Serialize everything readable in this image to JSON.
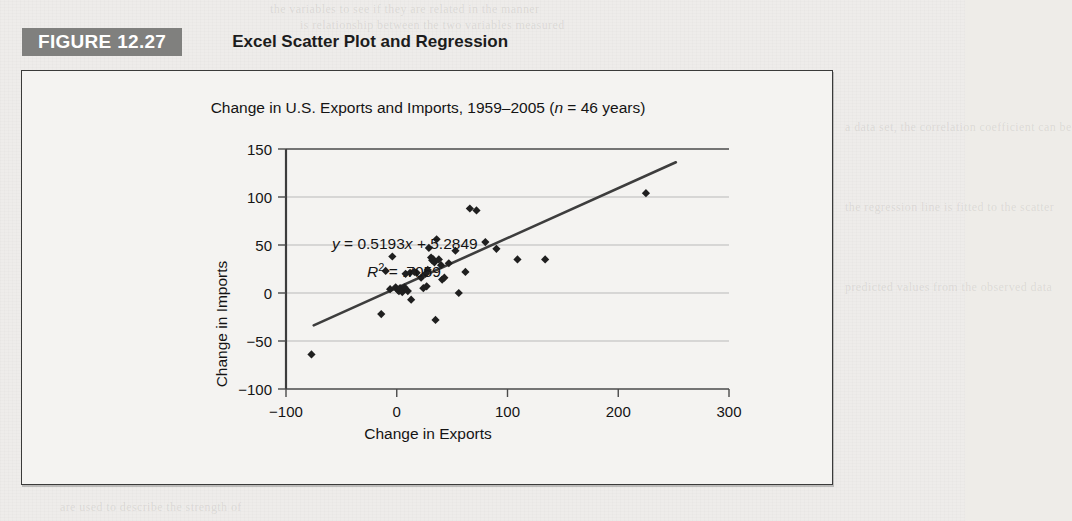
{
  "figure": {
    "badge_label": "FIGURE 12.27",
    "title": "Excel Scatter Plot and Regression"
  },
  "chart_data": {
    "type": "scatter",
    "title": "Change in U.S. Exports and Imports, 1959–2005 (n = 46 years)",
    "title_parts": {
      "before_n": "Change in U.S. Exports and Imports, 1959–2005 (",
      "n_symbol": "n",
      "after_n": " = 46 years)"
    },
    "xlabel": "Change in Exports",
    "ylabel": "Change in Imports",
    "xlim": [
      -100,
      300
    ],
    "ylim": [
      -100,
      150
    ],
    "xticks": [
      -100,
      0,
      100,
      200,
      300
    ],
    "yticks": [
      -100,
      -50,
      0,
      50,
      100,
      150
    ],
    "xtick_labels": [
      "−100",
      "0",
      "100",
      "200",
      "300"
    ],
    "ytick_labels": [
      "−100",
      "−50",
      "0",
      "50",
      "100",
      "150"
    ],
    "grid": "horizontal",
    "legend": "none",
    "marker": "diamond",
    "marker_color": "#1f1f1f",
    "line_color": "#3d3d3d",
    "annotations": {
      "equation": "y = 0.5193x + 5.2849",
      "equation_parts": {
        "y_symbol": "y",
        "rest_before_x": " = 0.5193",
        "x_symbol": "x",
        "rest_after_x": " + 5.2849"
      },
      "r_squared": "R² = .7059",
      "r_squared_parts": {
        "r_symbol": "R",
        "exponent": "2",
        "value": " = .7059"
      }
    },
    "regression": {
      "slope": 0.5193,
      "intercept": 5.2849,
      "r_squared": 0.7059,
      "line_x_start": -75,
      "line_x_end": 252
    },
    "n": 46,
    "points": [
      [
        -77,
        -64
      ],
      [
        -14,
        -22
      ],
      [
        -10,
        23
      ],
      [
        -6,
        4
      ],
      [
        -4,
        38
      ],
      [
        -1,
        6
      ],
      [
        1,
        3
      ],
      [
        2,
        2
      ],
      [
        3,
        5
      ],
      [
        4,
        4
      ],
      [
        5,
        1
      ],
      [
        6,
        3
      ],
      [
        7,
        6
      ],
      [
        8,
        20
      ],
      [
        10,
        2
      ],
      [
        12,
        21
      ],
      [
        13,
        -7
      ],
      [
        16,
        22
      ],
      [
        18,
        21
      ],
      [
        22,
        16
      ],
      [
        24,
        5
      ],
      [
        26,
        20
      ],
      [
        27,
        7
      ],
      [
        28,
        24
      ],
      [
        29,
        47
      ],
      [
        31,
        37
      ],
      [
        32,
        34
      ],
      [
        33,
        35
      ],
      [
        34,
        32
      ],
      [
        35,
        -28
      ],
      [
        36,
        56
      ],
      [
        38,
        35
      ],
      [
        40,
        29
      ],
      [
        41,
        14
      ],
      [
        43,
        16
      ],
      [
        47,
        31
      ],
      [
        53,
        44
      ],
      [
        56,
        0
      ],
      [
        62,
        22
      ],
      [
        66,
        88
      ],
      [
        72,
        86
      ],
      [
        80,
        53
      ],
      [
        90,
        46
      ],
      [
        109,
        35
      ],
      [
        134,
        35
      ],
      [
        225,
        104
      ]
    ]
  },
  "bleed_text": [
    "the variables to see if they are related in the manner",
    "is relationship between the two variables measured",
    "a data set, the correlation coefficient can be",
    "the regression line is fitted to the scatter",
    "predicted values from the observed data",
    "are used to describe the strength of"
  ]
}
